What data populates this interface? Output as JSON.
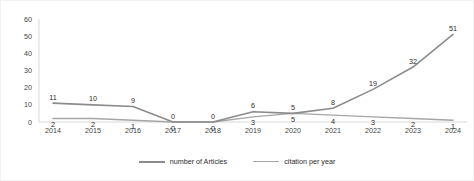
{
  "chart_data": {
    "type": "line",
    "title": "",
    "xlabel": "",
    "ylabel": "",
    "categories": [
      "2014",
      "2015",
      "2016",
      "2017",
      "2018",
      "2019",
      "2020",
      "2021",
      "2022",
      "2023",
      "2024"
    ],
    "ylim": [
      0,
      60
    ],
    "yticks": [
      "0",
      "10",
      "20",
      "30",
      "40",
      "50",
      "60"
    ],
    "grid": false,
    "legend_position": "bottom",
    "series": [
      {
        "name": "number of Articles",
        "color": "#8c8c8c",
        "values": [
          2,
          2,
          1,
          0,
          0,
          3,
          5,
          4,
          3,
          2,
          1
        ]
      },
      {
        "name": "citation per year",
        "color": "#a6a6a6",
        "values": [
          11,
          10,
          9,
          0,
          0,
          6,
          5,
          8,
          19,
          32,
          51
        ]
      }
    ]
  },
  "legend": {
    "items": [
      {
        "label": "number of Articles"
      },
      {
        "label": "citation per year"
      }
    ]
  }
}
